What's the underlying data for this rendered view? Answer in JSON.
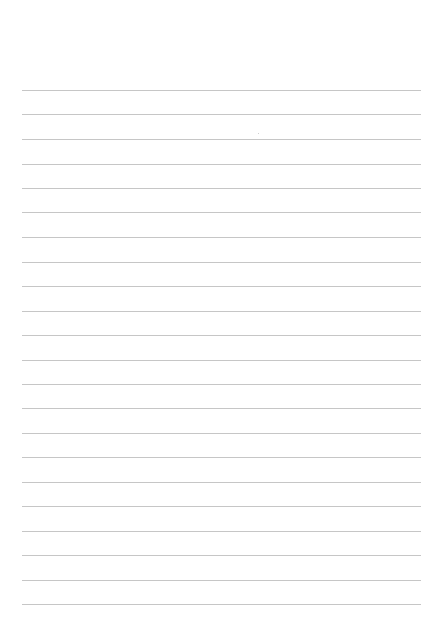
{
  "page": {
    "type": "lined-paper",
    "background": "#ffffff",
    "rule_color": "#c6c6c6",
    "rule_left": 22,
    "rule_right": 421,
    "rule_count": 22,
    "rules_y": [
      90,
      114,
      139,
      164,
      188,
      212,
      237,
      262,
      286,
      311,
      335,
      360,
      384,
      408,
      433,
      457,
      482,
      506,
      531,
      555,
      580,
      604
    ],
    "text": ""
  }
}
